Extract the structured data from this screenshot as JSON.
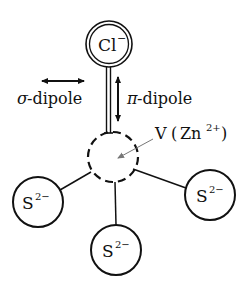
{
  "diagram": {
    "center_ion": {
      "label": "V",
      "paren_open": "(",
      "species": "Zn",
      "charge": "2+",
      "paren_close": ")"
    },
    "apical_ion": {
      "label": "Cl",
      "charge": "−"
    },
    "ligands": [
      {
        "label": "S",
        "charge": "2−"
      },
      {
        "label": "S",
        "charge": "2−"
      },
      {
        "label": "S",
        "charge": "2−"
      }
    ],
    "annotations": {
      "sigma_dipole": {
        "symbol": "σ",
        "text": "-dipole"
      },
      "pi_dipole": {
        "symbol": "π",
        "text": "-dipole"
      }
    },
    "colors": {
      "stroke": "#111111",
      "pointer": "#777777",
      "background": "#ffffff"
    }
  }
}
